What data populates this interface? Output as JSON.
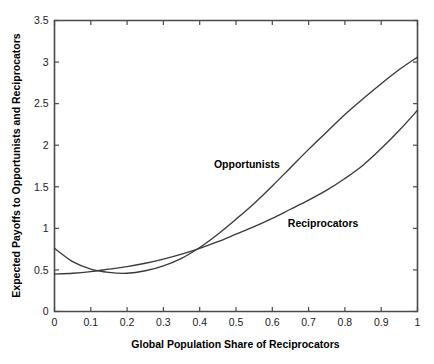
{
  "chart_data": {
    "type": "line",
    "title": "",
    "xlabel": "Global Population Share of Reciprocators",
    "ylabel": "Expected Payoffs to Opportunists and Reciprocators",
    "xlim": [
      0,
      1
    ],
    "ylim": [
      0,
      3.5
    ],
    "grid": false,
    "legend_position": "inline-annotations",
    "xticks": [
      "0",
      "0.1",
      "0.2",
      "0.3",
      "0.4",
      "0.5",
      "0.6",
      "0.7",
      "0.8",
      "0.9",
      "1"
    ],
    "xtick_values": [
      0,
      0.1,
      0.2,
      0.3,
      0.4,
      0.5,
      0.6,
      0.7,
      0.8,
      0.9,
      1
    ],
    "yticks": [
      "0",
      "0.5",
      "1",
      "1.5",
      "2",
      "2.5",
      "3",
      "3.5"
    ],
    "ytick_values": [
      0,
      0.5,
      1,
      1.5,
      2,
      2.5,
      3,
      3.5
    ],
    "x": [
      0,
      0.05,
      0.1,
      0.15,
      0.2,
      0.25,
      0.3,
      0.35,
      0.4,
      0.45,
      0.5,
      0.55,
      0.6,
      0.65,
      0.7,
      0.75,
      0.8,
      0.85,
      0.9,
      0.95,
      1
    ],
    "series": [
      {
        "name": "Opportunists",
        "color": "#3a3a3a",
        "values": [
          0.76,
          0.6,
          0.51,
          0.47,
          0.46,
          0.49,
          0.55,
          0.64,
          0.77,
          0.93,
          1.11,
          1.3,
          1.51,
          1.73,
          1.95,
          2.16,
          2.37,
          2.56,
          2.74,
          2.91,
          3.06
        ],
        "label_x": 0.53,
        "label_y": 1.72
      },
      {
        "name": "Reciprocators",
        "color": "#3a3a3a",
        "values": [
          0.45,
          0.46,
          0.48,
          0.51,
          0.54,
          0.58,
          0.63,
          0.69,
          0.76,
          0.84,
          0.93,
          1.02,
          1.12,
          1.23,
          1.34,
          1.46,
          1.6,
          1.76,
          1.96,
          2.18,
          2.42
        ],
        "label_x": 0.74,
        "label_y": 1.02
      }
    ],
    "annotations": [
      {
        "text": "Opportunists",
        "x": 0.53,
        "y": 1.72
      },
      {
        "text": "Reciprocators",
        "x": 0.74,
        "y": 1.02
      }
    ]
  },
  "axis_titles": {
    "x": "Global Population Share of Reciprocators",
    "y": "Expected Payoffs to Opportunists and Reciprocators"
  },
  "colors": {
    "curve": "#3a3a3a",
    "axis": "#4a4a4a",
    "text": "#000000",
    "background": "#ffffff"
  }
}
